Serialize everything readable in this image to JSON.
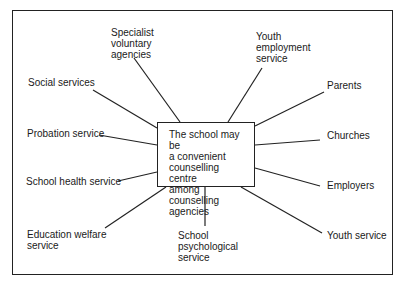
{
  "diagram": {
    "center": {
      "text": "The school may be\na convenient\ncounselling centre\namong counselling\nagencies"
    },
    "nodes": [
      {
        "id": "specialist-voluntary-agencies",
        "label": "Specialist\nvoluntary\nagencies"
      },
      {
        "id": "youth-employment-service",
        "label": "Youth\nemployment\nservice"
      },
      {
        "id": "social-services",
        "label": "Social services"
      },
      {
        "id": "parents",
        "label": "Parents"
      },
      {
        "id": "probation-service",
        "label": "Probation service"
      },
      {
        "id": "churches",
        "label": "Churches"
      },
      {
        "id": "school-health-service",
        "label": "School health service"
      },
      {
        "id": "employers",
        "label": "Employers"
      },
      {
        "id": "education-welfare-service",
        "label": "Education welfare\nservice"
      },
      {
        "id": "school-psychological-service",
        "label": "School\npsychological\nservice"
      },
      {
        "id": "youth-service",
        "label": "Youth service"
      }
    ],
    "line_color": "#222222"
  }
}
